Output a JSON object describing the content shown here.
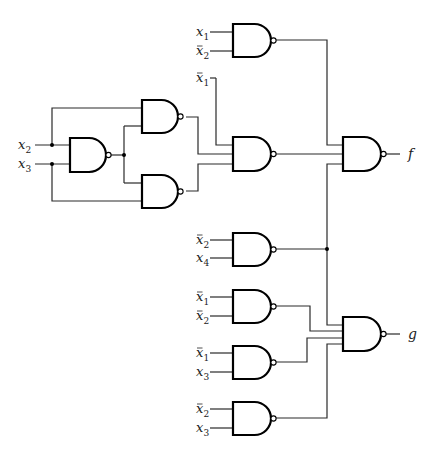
{
  "diagram": {
    "title": "NAND-gate logic circuit with outputs f and g",
    "type": "logic-circuit",
    "gate_type": "NAND",
    "colors": {
      "line": "#2a2a2a",
      "gate": "#000000",
      "background": "#ffffff"
    },
    "inputs": [
      {
        "id": "in_g1_a",
        "var": "x",
        "sub": "1",
        "negated": false,
        "x": 196,
        "y": 32,
        "wire_to": 233
      },
      {
        "id": "in_g1_b",
        "var": "x",
        "sub": "2",
        "negated": true,
        "x": 196,
        "y": 51,
        "wire_to": 233
      },
      {
        "id": "in_g2_a",
        "var": "x",
        "sub": "1",
        "negated": true,
        "x": 196,
        "y": 78,
        "wire_to": 216
      },
      {
        "id": "in_x2",
        "var": "x",
        "sub": "2",
        "negated": false,
        "x": 18,
        "y": 145,
        "wire_to": 70
      },
      {
        "id": "in_x3",
        "var": "x",
        "sub": "3",
        "negated": false,
        "x": 18,
        "y": 164,
        "wire_to": 70
      },
      {
        "id": "in_g3_a",
        "var": "x",
        "sub": "2",
        "negated": true,
        "x": 196,
        "y": 240,
        "wire_to": 233
      },
      {
        "id": "in_g3_b",
        "var": "x",
        "sub": "4",
        "negated": false,
        "x": 196,
        "y": 258,
        "wire_to": 233
      },
      {
        "id": "in_g4_a",
        "var": "x",
        "sub": "1",
        "negated": true,
        "x": 196,
        "y": 297,
        "wire_to": 233
      },
      {
        "id": "in_g4_b",
        "var": "x",
        "sub": "2",
        "negated": true,
        "x": 196,
        "y": 316,
        "wire_to": 233
      },
      {
        "id": "in_g5_a",
        "var": "x",
        "sub": "1",
        "negated": true,
        "x": 196,
        "y": 353,
        "wire_to": 233
      },
      {
        "id": "in_g5_b",
        "var": "x",
        "sub": "3",
        "negated": false,
        "x": 196,
        "y": 372,
        "wire_to": 233
      },
      {
        "id": "in_g6_a",
        "var": "x",
        "sub": "2",
        "negated": true,
        "x": 196,
        "y": 409,
        "wire_to": 233
      },
      {
        "id": "in_g6_b",
        "var": "x",
        "sub": "3",
        "negated": false,
        "x": 196,
        "y": 428,
        "wire_to": 233
      }
    ],
    "gates": [
      {
        "id": "gate-g1",
        "x": 233,
        "y": 24,
        "w": 38,
        "h": 33
      },
      {
        "id": "gate-ga",
        "x": 70,
        "y": 138,
        "w": 36,
        "h": 34
      },
      {
        "id": "gate-gb",
        "x": 142,
        "y": 100,
        "w": 36,
        "h": 33
      },
      {
        "id": "gate-gc",
        "x": 142,
        "y": 175,
        "w": 36,
        "h": 33
      },
      {
        "id": "gate-g2",
        "x": 233,
        "y": 137,
        "w": 38,
        "h": 34
      },
      {
        "id": "gate-f",
        "x": 343,
        "y": 137,
        "w": 38,
        "h": 34
      },
      {
        "id": "gate-g3",
        "x": 233,
        "y": 233,
        "w": 38,
        "h": 33
      },
      {
        "id": "gate-g4",
        "x": 233,
        "y": 290,
        "w": 38,
        "h": 33
      },
      {
        "id": "gate-g5",
        "x": 233,
        "y": 346,
        "w": 38,
        "h": 33
      },
      {
        "id": "gate-g",
        "x": 343,
        "y": 317,
        "w": 38,
        "h": 34
      },
      {
        "id": "gate-g6",
        "x": 233,
        "y": 402,
        "w": 38,
        "h": 33
      }
    ],
    "wires": [
      [
        [
          52,
          145
        ],
        [
          52,
          108
        ],
        [
          142,
          108
        ]
      ],
      [
        [
          52,
          164
        ],
        [
          52,
          201
        ],
        [
          142,
          201
        ]
      ],
      [
        [
          110,
          155
        ],
        [
          124,
          155
        ]
      ],
      [
        [
          124,
          126
        ],
        [
          124,
          183
        ]
      ],
      [
        [
          124,
          126
        ],
        [
          142,
          126
        ]
      ],
      [
        [
          124,
          183
        ],
        [
          142,
          183
        ]
      ],
      [
        [
          186,
          117
        ],
        [
          198,
          117
        ],
        [
          198,
          154
        ],
        [
          233,
          154
        ]
      ],
      [
        [
          186,
          191
        ],
        [
          198,
          191
        ],
        [
          198,
          164
        ],
        [
          233,
          164
        ]
      ],
      [
        [
          216,
          78
        ],
        [
          216,
          145
        ],
        [
          233,
          145
        ]
      ],
      [
        [
          276,
          40
        ],
        [
          327,
          40
        ],
        [
          327,
          145
        ],
        [
          343,
          145
        ]
      ],
      [
        [
          276,
          154
        ],
        [
          343,
          154
        ]
      ],
      [
        [
          276,
          249
        ],
        [
          327,
          249
        ]
      ],
      [
        [
          343,
          164
        ],
        [
          327,
          164
        ],
        [
          327,
          325
        ],
        [
          343,
          325
        ]
      ],
      [
        [
          276,
          306
        ],
        [
          310,
          306
        ],
        [
          310,
          331
        ],
        [
          343,
          331
        ]
      ],
      [
        [
          276,
          362
        ],
        [
          307,
          362
        ],
        [
          307,
          338
        ],
        [
          343,
          338
        ]
      ],
      [
        [
          276,
          418
        ],
        [
          327,
          418
        ],
        [
          327,
          344
        ],
        [
          343,
          344
        ]
      ],
      [
        [
          386,
          154
        ],
        [
          400,
          154
        ]
      ],
      [
        [
          386,
          334
        ],
        [
          400,
          334
        ]
      ]
    ],
    "junctions": [
      [
        52,
        145
      ],
      [
        52,
        164
      ],
      [
        124,
        155
      ],
      [
        327,
        249
      ]
    ],
    "outputs": [
      {
        "id": "output-f",
        "label": "f",
        "x": 408,
        "y": 159
      },
      {
        "id": "output-g",
        "label": "g",
        "x": 408,
        "y": 339
      }
    ]
  }
}
